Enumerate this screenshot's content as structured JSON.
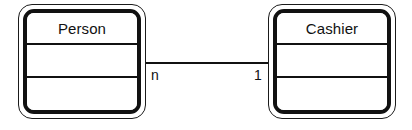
{
  "diagram": {
    "type": "uml-class-diagram",
    "background_color": "#ffffff",
    "line_color": "#111111"
  },
  "classes": [
    {
      "id": "person",
      "name": "Person",
      "compartments": [
        "Person",
        "",
        ""
      ],
      "x": 18,
      "y": 4,
      "width": 128,
      "height": 115
    },
    {
      "id": "cashier",
      "name": "Cashier",
      "compartments": [
        "Cashier",
        "",
        ""
      ],
      "x": 268,
      "y": 4,
      "width": 128,
      "height": 115
    }
  ],
  "association": {
    "source_multiplicity": "n",
    "target_multiplicity": "1",
    "line_y": 62,
    "line_x1": 146,
    "line_x2": 268
  }
}
